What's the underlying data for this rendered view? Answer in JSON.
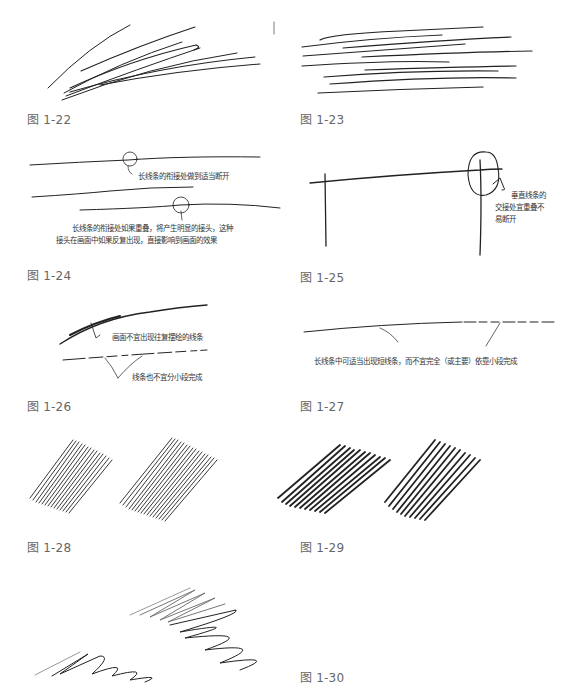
{
  "figures": [
    {
      "id": "1-22",
      "caption": "图 1-22",
      "notes": []
    },
    {
      "id": "1-23",
      "caption": "图 1-23",
      "notes": []
    },
    {
      "id": "1-24",
      "caption": "图 1-24",
      "notes": [
        "长线条的衔接处做到适当断开",
        "长线条的衔接处如果重叠，将产生明显的接头，这种",
        "接头在画面中如果反复出现，直接影响到画面的效果"
      ]
    },
    {
      "id": "1-25",
      "caption": "图 1-25",
      "notes": [
        "垂直线条的",
        "交接处宜重叠不",
        "易断开"
      ]
    },
    {
      "id": "1-26",
      "caption": "图 1-26",
      "notes": [
        "画面不宜出现往复摆绘的线条",
        "线条也不宜分小段完成"
      ]
    },
    {
      "id": "1-27",
      "caption": "图 1-27",
      "notes": [
        "长线条中可适当出现短线条，而不宜完全（或主要）依靠小段完成"
      ]
    },
    {
      "id": "1-28",
      "caption": "图 1-28",
      "notes": []
    },
    {
      "id": "1-29",
      "caption": "图 1-29",
      "notes": []
    },
    {
      "id": "1-30",
      "caption": "图 1-30",
      "notes": []
    }
  ],
  "colors": {
    "ink": "#222222",
    "caption": "#666666",
    "background": "#ffffff"
  }
}
